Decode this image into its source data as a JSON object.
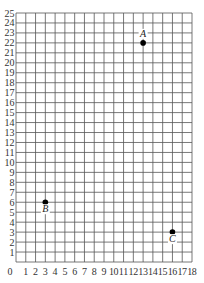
{
  "chart_data": {
    "type": "scatter",
    "title": "",
    "xlabel": "",
    "ylabel": "",
    "xlim": [
      0,
      18
    ],
    "ylim": [
      0,
      25
    ],
    "grid": true,
    "x_ticks": [
      "0",
      "1",
      "2",
      "3",
      "4",
      "5",
      "6",
      "7",
      "8",
      "9",
      "10",
      "11",
      "12",
      "13",
      "14",
      "15",
      "16",
      "17",
      "18"
    ],
    "y_ticks": [
      "1",
      "2",
      "3",
      "4",
      "5",
      "6",
      "7",
      "8",
      "9",
      "10",
      "11",
      "12",
      "13",
      "14",
      "15",
      "16",
      "17",
      "18",
      "19",
      "20",
      "21",
      "22",
      "23",
      "24",
      "25"
    ],
    "points": [
      {
        "label": "A",
        "x": 13,
        "y": 22
      },
      {
        "label": "B",
        "x": 3,
        "y": 6
      },
      {
        "label": "C",
        "x": 16,
        "y": 3
      }
    ]
  },
  "colors": {
    "grid": "#555555",
    "point": "#000000",
    "background": "#ffffff"
  }
}
